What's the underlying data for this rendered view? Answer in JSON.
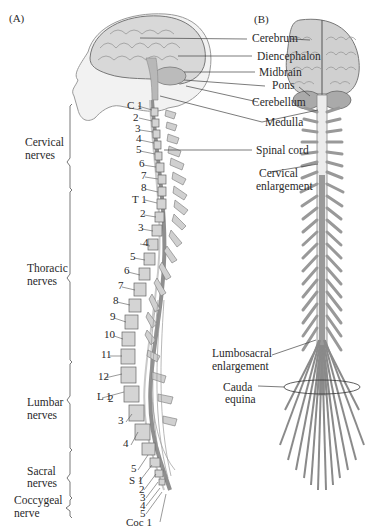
{
  "panels": {
    "a": "(A)",
    "b": "(B)"
  },
  "brain_labels": {
    "cerebrum": "Cerebrum",
    "diencephalon": "Diencephalon",
    "midbrain": "Midbrain",
    "pons": "Pons",
    "cerebellum": "Cerebellum",
    "medulla": "Medulla",
    "spinal_cord": "Spinal cord",
    "cervical_enlargement_1": "Cervical",
    "cervical_enlargement_2": "enlargement",
    "lumbosacral_enlargement_1": "Lumbosacral",
    "lumbosacral_enlargement_2": "enlargement",
    "cauda_equina_1": "Cauda",
    "cauda_equina_2": "equina"
  },
  "nerve_groups": {
    "cervical_1": "Cervical",
    "cervical_2": "nerves",
    "thoracic_1": "Thoracic",
    "thoracic_2": "nerves",
    "lumbar_1": "Lumbar",
    "lumbar_2": "nerves",
    "sacral_1": "Sacral",
    "sacral_2": "nerves",
    "coccygeal_1": "Coccygeal",
    "coccygeal_2": "nerve"
  },
  "vertebrae": {
    "cervical": [
      "C 1",
      "2",
      "3",
      "4",
      "5",
      "6",
      "7",
      "8"
    ],
    "thoracic": [
      "T 1",
      "2",
      "3",
      "4",
      "5",
      "6",
      "7",
      "8",
      "9",
      "10",
      "11",
      "12"
    ],
    "lumbar": [
      "L 1",
      "2",
      "3",
      "4",
      "5"
    ],
    "sacral": [
      "S 1",
      "2",
      "3",
      "4",
      "5"
    ],
    "coccygeal": [
      "Coc 1"
    ]
  },
  "colors": {
    "bone": "#d4d4d4",
    "cord": "#9a9a9a",
    "line": "#333333",
    "brain": "#c8c8c8"
  }
}
